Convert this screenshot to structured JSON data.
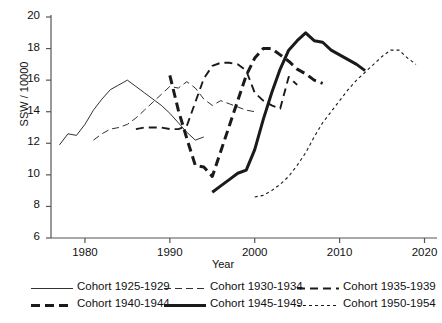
{
  "chart_data": {
    "type": "line",
    "title": "",
    "xlabel": "Year",
    "ylabel": "SSW / 10000",
    "xlim": [
      1976,
      2021
    ],
    "ylim": [
      6,
      20
    ],
    "xticks": [
      1980,
      1990,
      2000,
      2010,
      2020
    ],
    "yticks": [
      6,
      8,
      10,
      12,
      14,
      16,
      18,
      20
    ],
    "grid": false,
    "legend_position": "bottom",
    "series": [
      {
        "name": "Cohort 1925-1929",
        "style": "solid-thin",
        "x": [
          1977,
          1978,
          1979,
          1980,
          1981,
          1982,
          1983,
          1984,
          1985,
          1986,
          1987,
          1988,
          1989,
          1990,
          1991,
          1992,
          1993,
          1994
        ],
        "values": [
          11.9,
          12.6,
          12.5,
          13.2,
          14.1,
          14.8,
          15.4,
          15.7,
          16.0,
          15.6,
          15.2,
          14.8,
          14.4,
          13.9,
          13.3,
          12.7,
          12.2,
          12.4
        ]
      },
      {
        "name": "Cohort 1930-1934",
        "style": "dashed-thin",
        "x": [
          1981,
          1982,
          1983,
          1984,
          1985,
          1986,
          1987,
          1988,
          1989,
          1990,
          1991,
          1992,
          1993,
          1994,
          1995,
          1996,
          1997,
          1998,
          1999,
          2000
        ],
        "values": [
          12.2,
          12.6,
          12.9,
          13.0,
          13.2,
          13.6,
          14.1,
          14.6,
          15.1,
          15.6,
          15.5,
          15.9,
          15.5,
          14.8,
          14.4,
          14.7,
          14.5,
          14.3,
          14.1,
          14.0
        ]
      },
      {
        "name": "Cohort 1935-1939",
        "style": "dashed-medium",
        "x": [
          1986,
          1987,
          1988,
          1989,
          1990,
          1991,
          1992,
          1993,
          1994,
          1995,
          1996,
          1997,
          1998,
          1999,
          2000,
          2001,
          2002,
          2003,
          2004,
          2005
        ],
        "values": [
          12.9,
          13.0,
          13.0,
          13.0,
          12.9,
          12.9,
          13.1,
          14.6,
          16.1,
          16.9,
          17.1,
          17.1,
          17.0,
          16.6,
          15.2,
          14.7,
          14.4,
          14.2,
          16.2,
          15.7
        ]
      },
      {
        "name": "Cohort 1940-1944",
        "style": "dashed-bold",
        "x": [
          1990,
          1991,
          1992,
          1993,
          1994,
          1995,
          1996,
          1997,
          1998,
          1999,
          2000,
          2001,
          2002,
          2003,
          2004,
          2005,
          2006,
          2007,
          2008
        ],
        "values": [
          16.3,
          14.1,
          12.3,
          10.6,
          10.5,
          9.9,
          11.5,
          13.1,
          14.7,
          16.3,
          17.4,
          18.0,
          18.0,
          17.6,
          17.2,
          16.7,
          16.4,
          16.0,
          15.8
        ]
      },
      {
        "name": "Cohort 1945-1949",
        "style": "solid-bold",
        "x": [
          1995,
          1996,
          1997,
          1998,
          1999,
          2000,
          2001,
          2002,
          2003,
          2004,
          2005,
          2006,
          2007,
          2008,
          2009,
          2010,
          2011,
          2012,
          2013
        ],
        "values": [
          8.9,
          9.3,
          9.7,
          10.1,
          10.3,
          11.6,
          13.5,
          15.2,
          16.7,
          17.9,
          18.5,
          19.0,
          18.5,
          18.4,
          17.9,
          17.6,
          17.3,
          17.0,
          16.6
        ]
      },
      {
        "name": "Cohort 1950-1954",
        "style": "dotted-fine",
        "x": [
          2000,
          2001,
          2002,
          2003,
          2004,
          2005,
          2006,
          2007,
          2008,
          2009,
          2010,
          2011,
          2012,
          2013,
          2014,
          2015,
          2016,
          2017,
          2018,
          2019
        ],
        "values": [
          8.6,
          8.7,
          9.0,
          9.4,
          9.9,
          10.6,
          11.4,
          12.4,
          13.3,
          14.0,
          14.7,
          15.4,
          16.0,
          16.5,
          17.0,
          17.5,
          17.9,
          17.9,
          17.4,
          17.0
        ]
      }
    ],
    "legend": [
      "Cohort 1925-1929",
      "Cohort 1930-1934",
      "Cohort 1935-1939",
      "Cohort 1940-1944",
      "Cohort 1945-1949",
      "Cohort 1950-1954"
    ]
  },
  "axes": {
    "ylabel": "SSW / 10000",
    "xlabel": "Year",
    "ytick_labels": [
      "20",
      "18",
      "16",
      "14",
      "12",
      "10",
      "8",
      "6"
    ],
    "xtick_labels": [
      "1980",
      "1990",
      "2000",
      "2010",
      "2020"
    ]
  },
  "colors": {
    "line": "#1a1a1a",
    "axis": "#555555",
    "background": "#ffffff"
  }
}
